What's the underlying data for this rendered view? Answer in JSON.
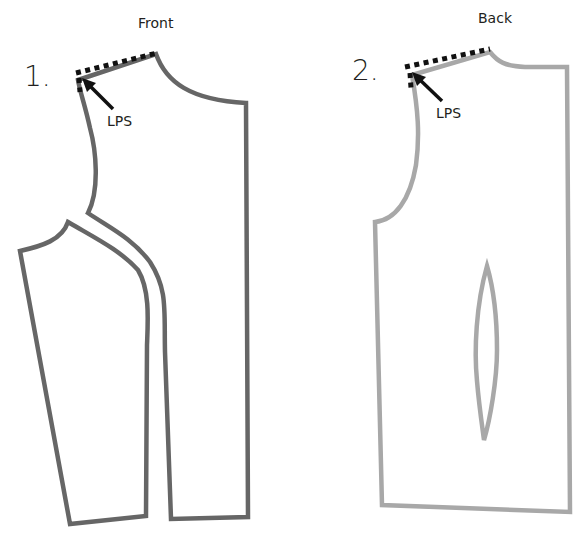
{
  "figure": {
    "panels": [
      {
        "number": "1.",
        "title": "Front",
        "annotation": "LPS",
        "stroke_color": "#666666"
      },
      {
        "number": "2.",
        "title": "Back",
        "annotation": "LPS",
        "stroke_color": "#a8a8a8"
      }
    ],
    "dotted_line_color": "#111111",
    "arrow_color": "#111111"
  }
}
